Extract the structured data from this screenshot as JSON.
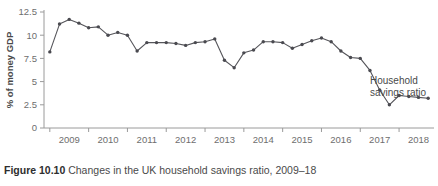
{
  "caption": {
    "label": "Figure 10.10",
    "text": " Changes in the UK household savings ratio, 2009–18"
  },
  "annotation": {
    "line1": "Household",
    "line2": "savings ratio"
  },
  "chart_data": {
    "type": "line",
    "title": "",
    "xlabel": "",
    "ylabel": "% of money GDP",
    "ylim": [
      0,
      12.5
    ],
    "yticks": [
      0,
      2.5,
      5,
      7.5,
      10,
      12.5
    ],
    "ytick_labels": [
      "0",
      "2.5",
      "5",
      "7.5",
      "10",
      "12.5"
    ],
    "xtick_labels": [
      "2009",
      "2010",
      "2011",
      "2012",
      "2013",
      "2014",
      "2015",
      "2016",
      "2017",
      "2018"
    ],
    "grid": false,
    "legend": "none",
    "line_color": "#55555a",
    "marker_color": "#4a4a50",
    "axis_color": "#9a9a9a",
    "series": [
      {
        "name": "Household savings ratio",
        "x": [
          2008.75,
          2009.0,
          2009.25,
          2009.5,
          2009.75,
          2010.0,
          2010.25,
          2010.5,
          2010.75,
          2011.0,
          2011.25,
          2011.5,
          2011.75,
          2012.0,
          2012.25,
          2012.5,
          2012.75,
          2013.0,
          2013.25,
          2013.5,
          2013.75,
          2014.0,
          2014.25,
          2014.5,
          2014.75,
          2015.0,
          2015.25,
          2015.5,
          2015.75,
          2016.0,
          2016.25,
          2016.5,
          2016.75,
          2017.0,
          2017.25,
          2017.5,
          2017.75,
          2018.0,
          2018.25,
          2018.5
        ],
        "values": [
          8.2,
          11.2,
          11.7,
          11.3,
          10.8,
          10.9,
          10.0,
          10.3,
          10.0,
          8.3,
          9.2,
          9.2,
          9.2,
          9.1,
          8.9,
          9.2,
          9.3,
          9.6,
          7.3,
          6.5,
          8.1,
          8.4,
          9.3,
          9.3,
          9.2,
          8.6,
          9.0,
          9.4,
          9.7,
          9.3,
          8.3,
          7.6,
          7.5,
          6.2,
          4.1,
          2.5,
          3.5,
          3.4,
          3.3,
          3.2
        ]
      }
    ]
  }
}
